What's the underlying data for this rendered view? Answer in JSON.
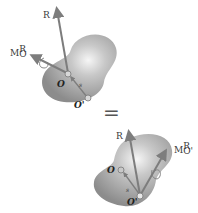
{
  "figure": {
    "top_system": {
      "force_label": "R",
      "moment_label": {
        "base": "M",
        "sup": "R",
        "sub": "O"
      },
      "point_O_label": "O",
      "point_Oprime_label": "O'",
      "position_vector_label": "s"
    },
    "equals_sign": "=",
    "bottom_system": {
      "force_label": "R",
      "moment_label": {
        "base": "M",
        "sup": "R",
        "sub": "O'"
      },
      "point_O_label": "O",
      "point_Oprime_label": "O'",
      "position_vector_label": "s"
    },
    "colors": {
      "body_fill": "#9a9a9a",
      "body_highlight": "#f4f4f4",
      "arrow": "#7d7d7d",
      "text": "#333333"
    }
  }
}
